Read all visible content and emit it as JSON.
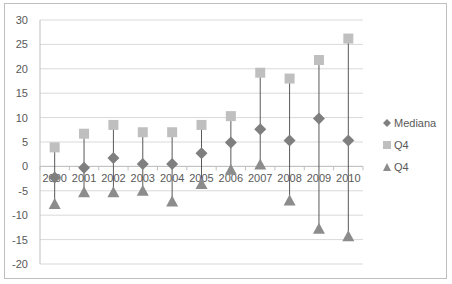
{
  "chart_data": {
    "type": "scatter",
    "subtype": "high-low-median stock-style chart",
    "title": "",
    "xlabel": "",
    "ylabel": "",
    "categories": [
      "2000",
      "2001",
      "2002",
      "2003",
      "2004",
      "2005",
      "2006",
      "2007",
      "2008",
      "2009",
      "2010"
    ],
    "series": [
      {
        "name": "Mediana",
        "marker": "diamond",
        "color": "#7f7f7f",
        "values": [
          -2.3,
          -0.3,
          1.7,
          0.5,
          0.5,
          2.7,
          4.9,
          7.6,
          5.3,
          9.8,
          5.3
        ]
      },
      {
        "name": "Q4",
        "marker": "square",
        "color": "#bfbfbf",
        "values": [
          3.9,
          6.7,
          8.5,
          7.0,
          7.0,
          8.5,
          10.3,
          19.2,
          18.0,
          21.8,
          26.2
        ]
      },
      {
        "name": "Q4",
        "marker": "triangle",
        "color": "#8c8c8c",
        "values": [
          -7.7,
          -5.3,
          -5.3,
          -5.0,
          -7.2,
          -3.6,
          -0.7,
          0.4,
          -7.0,
          -12.8,
          -14.3
        ]
      }
    ],
    "ylim": [
      -20,
      30
    ],
    "yticks": [
      30,
      25,
      20,
      15,
      10,
      5,
      0,
      -5,
      -10,
      -15,
      -20
    ],
    "grid": true,
    "legend_position": "right",
    "high_low_lines": true
  },
  "legend": {
    "items": [
      {
        "label": "Mediana",
        "icon": "diamond-icon"
      },
      {
        "label": "Q4",
        "icon": "square-icon"
      },
      {
        "label": "Q4",
        "icon": "triangle-icon"
      }
    ]
  }
}
